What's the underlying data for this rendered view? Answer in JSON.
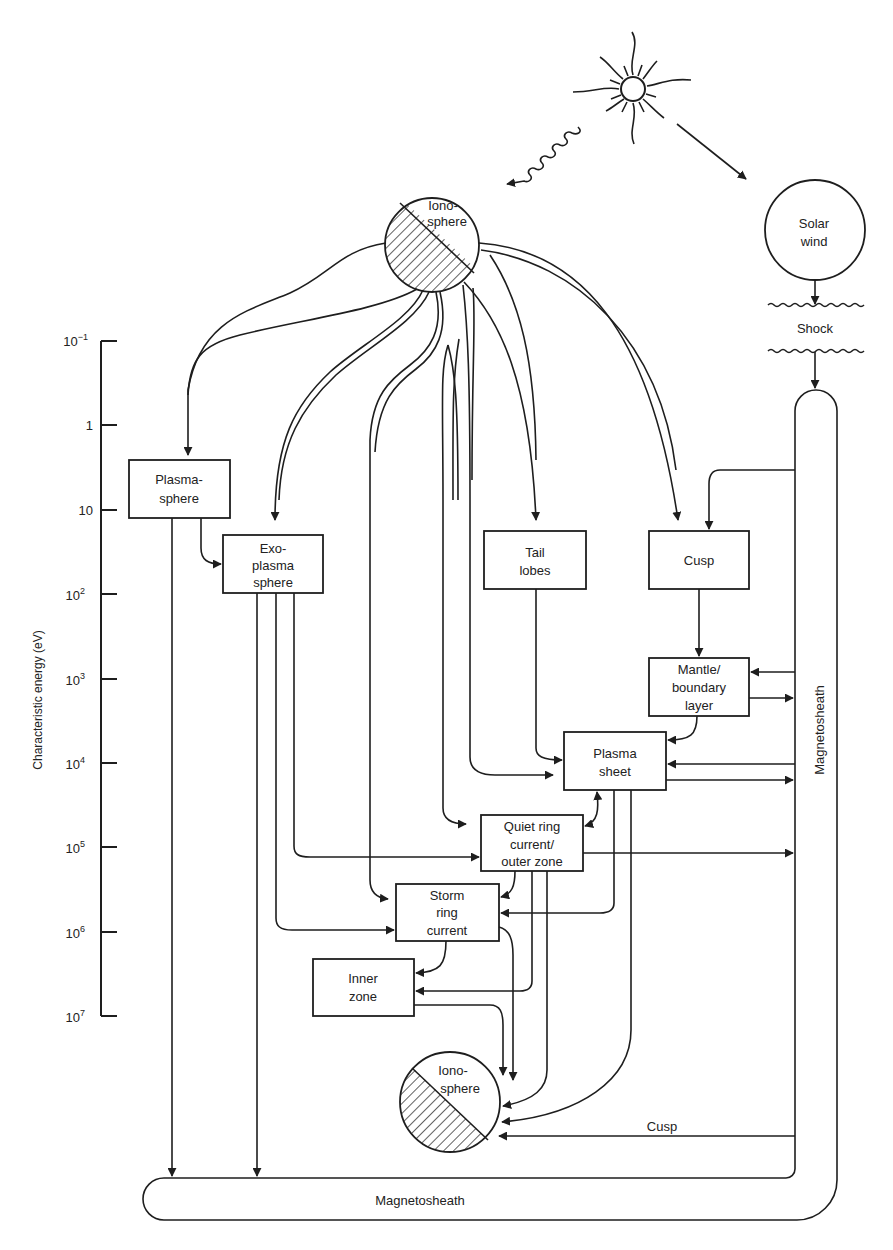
{
  "axis": {
    "label": "Characteristic energy (eV)",
    "ticks": [
      {
        "base": "10",
        "exp": "−1"
      },
      {
        "base": "1",
        "exp": ""
      },
      {
        "base": "10",
        "exp": ""
      },
      {
        "base": "10",
        "exp": "2"
      },
      {
        "base": "10",
        "exp": "3"
      },
      {
        "base": "10",
        "exp": "4"
      },
      {
        "base": "10",
        "exp": "5"
      },
      {
        "base": "10",
        "exp": "6"
      },
      {
        "base": "10",
        "exp": "7"
      }
    ]
  },
  "sources": {
    "sun_icon": "sun-icon",
    "ionosphere_top": {
      "line1": "Iono-",
      "line2": "sphere"
    },
    "solar_wind": {
      "line1": "Solar",
      "line2": "wind"
    },
    "shock": "Shock"
  },
  "boxes": {
    "plasmasphere": {
      "line1": "Plasma-",
      "line2": "sphere"
    },
    "exoplasmasphere": {
      "line1": "Exo-",
      "line2": "plasma",
      "line3": "sphere"
    },
    "tail_lobes": {
      "line1": "Tail",
      "line2": "lobes"
    },
    "cusp": {
      "line1": "Cusp"
    },
    "mantle": {
      "line1": "Mantle/",
      "line2": "boundary",
      "line3": "layer"
    },
    "plasma_sheet": {
      "line1": "Plasma",
      "line2": "sheet"
    },
    "quiet_ring": {
      "line1": "Quiet ring",
      "line2": "current/",
      "line3": "outer zone"
    },
    "storm_ring": {
      "line1": "Storm",
      "line2": "ring",
      "line3": "current"
    },
    "inner_zone": {
      "line1": "Inner",
      "line2": "zone"
    }
  },
  "sinks": {
    "ionosphere_bottom": {
      "line1": "Iono-",
      "line2": "sphere"
    },
    "magnetosheath_right": "Magnetosheath",
    "magnetosheath_bottom": "Magnetosheath",
    "cusp_path_label": "Cusp"
  }
}
